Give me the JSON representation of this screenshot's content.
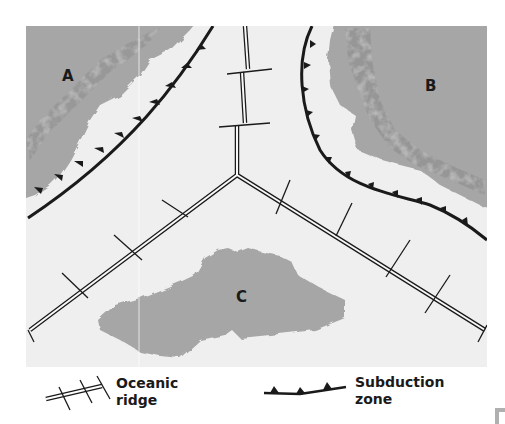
{
  "diagram": {
    "labels": {
      "plate_a": "A",
      "plate_b": "B",
      "plate_c": "C"
    },
    "legend": {
      "oceanic_ridge_line1": "Oceanic",
      "oceanic_ridge_line2": "ridge",
      "subduction_line1": "Subduction",
      "subduction_line2": "zone"
    },
    "colors": {
      "ocean": "#efefef",
      "land": "#a6a6a6",
      "line": "#1a1a1a",
      "ridge_fill": "#ffffff"
    }
  }
}
